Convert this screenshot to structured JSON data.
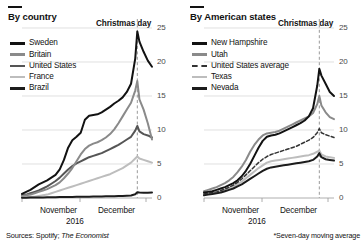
{
  "figure": {
    "width": 364,
    "height": 246,
    "source_text_prefix": "Sources: Spotify; ",
    "source_text_italic": "The Economist",
    "footnote": "*Seven-day moving average",
    "year_label": "2016"
  },
  "palette": {
    "black": "#121212",
    "dark_gray": "#555555",
    "mid_gray": "#8a8a8a",
    "light_gray": "#bdbdbd",
    "very_dark": "#1c1c1c",
    "grid": "#d2d2d2",
    "axis": "#9a9a9a",
    "tick_text": "#4a4a4a"
  },
  "panels": [
    {
      "id": "by-country",
      "title": "By country",
      "annotation": "Christmas day",
      "legend": [
        {
          "label": "Sweden",
          "color": "#121212",
          "style": "solid"
        },
        {
          "label": "Britain",
          "color": "#8a8a8a",
          "style": "solid"
        },
        {
          "label": "United States",
          "color": "#555555",
          "style": "solid"
        },
        {
          "label": "France",
          "color": "#bdbdbd",
          "style": "solid"
        },
        {
          "label": "Brazil",
          "color": "#1c1c1c",
          "style": "solid"
        }
      ],
      "chart_data": {
        "type": "line",
        "title": "By country",
        "xlabel": "2016",
        "ylabel": "",
        "ylim": [
          0,
          25
        ],
        "yticks": [
          0,
          5,
          10,
          15,
          20,
          25
        ],
        "ytick_labels": [
          "0",
          "5",
          "10",
          "15",
          "20",
          "25"
        ],
        "grid": true,
        "legend_position": "upper-left",
        "annotations": [
          {
            "text": "Christmas day",
            "x": 55,
            "style": "dashed-vertical"
          }
        ],
        "x_tick_labels": [
          "November",
          "December"
        ],
        "x": [
          0,
          2,
          4,
          6,
          8,
          10,
          12,
          14,
          16,
          18,
          20,
          22,
          24,
          26,
          28,
          30,
          32,
          34,
          36,
          38,
          40,
          42,
          44,
          46,
          48,
          50,
          52,
          54,
          55,
          56,
          58,
          60,
          62
        ],
        "series": [
          {
            "name": "Sweden",
            "color": "#121212",
            "style": "solid",
            "values": [
              0.6,
              0.9,
              1.2,
              1.6,
              2.0,
              2.3,
              2.6,
              3.0,
              3.4,
              4.2,
              5.6,
              7.4,
              8.5,
              9.0,
              9.6,
              11.5,
              12.1,
              12.2,
              12.3,
              12.6,
              13.0,
              13.4,
              13.9,
              14.3,
              14.8,
              15.6,
              16.8,
              20.5,
              24.5,
              23.0,
              21.5,
              20.2,
              19.3
            ]
          },
          {
            "name": "Britain",
            "color": "#8a8a8a",
            "style": "solid",
            "values": [
              0.3,
              0.4,
              0.5,
              0.7,
              0.9,
              1.1,
              1.3,
              1.6,
              1.9,
              2.3,
              2.9,
              3.6,
              4.4,
              5.4,
              6.4,
              7.2,
              7.7,
              8.0,
              8.2,
              8.5,
              8.9,
              9.4,
              10.1,
              11.0,
              12.0,
              13.0,
              14.0,
              15.8,
              17.2,
              14.5,
              13.0,
              11.0,
              8.6
            ]
          },
          {
            "name": "United States",
            "color": "#555555",
            "style": "solid",
            "values": [
              0.4,
              0.5,
              0.7,
              0.9,
              1.1,
              1.4,
              1.7,
              2.1,
              2.5,
              3.0,
              3.6,
              4.2,
              4.7,
              5.1,
              5.4,
              5.7,
              6.0,
              6.2,
              6.4,
              6.6,
              6.9,
              7.2,
              7.5,
              7.8,
              8.2,
              8.6,
              9.0,
              9.9,
              10.6,
              9.8,
              9.4,
              9.2,
              8.9
            ]
          },
          {
            "name": "France",
            "color": "#bdbdbd",
            "style": "solid",
            "values": [
              0.1,
              0.1,
              0.2,
              0.2,
              0.3,
              0.4,
              0.5,
              0.7,
              0.9,
              1.1,
              1.3,
              1.5,
              1.7,
              1.9,
              2.1,
              2.3,
              2.5,
              2.7,
              2.9,
              3.1,
              3.3,
              3.5,
              3.8,
              4.1,
              4.4,
              4.8,
              5.2,
              5.8,
              6.1,
              5.8,
              5.6,
              5.4,
              5.2
            ]
          },
          {
            "name": "Brazil",
            "color": "#1c1c1c",
            "style": "solid",
            "values": [
              0.05,
              0.05,
              0.06,
              0.07,
              0.08,
              0.09,
              0.1,
              0.11,
              0.12,
              0.13,
              0.14,
              0.15,
              0.16,
              0.17,
              0.18,
              0.19,
              0.2,
              0.21,
              0.22,
              0.23,
              0.24,
              0.25,
              0.27,
              0.29,
              0.31,
              0.34,
              0.38,
              0.55,
              0.85,
              0.8,
              0.78,
              0.78,
              0.8
            ]
          }
        ]
      }
    },
    {
      "id": "by-american-states",
      "title": "By American states",
      "annotation": "Christmas day",
      "legend": [
        {
          "label": "New Hampshire",
          "color": "#121212",
          "style": "solid"
        },
        {
          "label": "Utah",
          "color": "#8a8a8a",
          "style": "solid"
        },
        {
          "label": "United States average",
          "color": "#333333",
          "style": "dashed"
        },
        {
          "label": "Texas",
          "color": "#bdbdbd",
          "style": "solid"
        },
        {
          "label": "Nevada",
          "color": "#1c1c1c",
          "style": "solid"
        }
      ],
      "chart_data": {
        "type": "line",
        "title": "By American states",
        "xlabel": "2016",
        "ylabel": "",
        "ylim": [
          0,
          25
        ],
        "yticks": [
          0,
          5,
          10,
          15,
          20,
          25
        ],
        "ytick_labels": [
          "0",
          "5",
          "10",
          "15",
          "20",
          "25"
        ],
        "grid": true,
        "legend_position": "upper-left",
        "annotations": [
          {
            "text": "Christmas day",
            "x": 55,
            "style": "dashed-vertical"
          }
        ],
        "x_tick_labels": [
          "November",
          "December"
        ],
        "x": [
          0,
          2,
          4,
          6,
          8,
          10,
          12,
          14,
          16,
          18,
          20,
          22,
          24,
          26,
          28,
          30,
          32,
          34,
          36,
          38,
          40,
          42,
          44,
          46,
          48,
          50,
          52,
          54,
          55,
          56,
          58,
          60,
          62
        ],
        "series": [
          {
            "name": "New Hampshire",
            "color": "#121212",
            "style": "solid",
            "values": [
              0.8,
              0.9,
              1.0,
              1.2,
              1.4,
              1.6,
              1.9,
              2.2,
              2.6,
              3.2,
              4.0,
              5.0,
              6.2,
              7.4,
              8.4,
              9.0,
              9.2,
              9.3,
              9.5,
              9.8,
              10.1,
              10.4,
              10.7,
              11.0,
              11.4,
              12.0,
              13.2,
              16.5,
              19.0,
              18.0,
              16.8,
              15.6,
              15.0
            ]
          },
          {
            "name": "Utah",
            "color": "#8a8a8a",
            "style": "solid",
            "values": [
              1.0,
              1.2,
              1.4,
              1.6,
              1.9,
              2.2,
              2.6,
              3.1,
              3.8,
              4.6,
              5.6,
              6.8,
              7.8,
              8.6,
              9.2,
              9.5,
              9.6,
              9.7,
              9.9,
              10.2,
              10.5,
              10.8,
              11.1,
              11.4,
              11.7,
              12.0,
              12.5,
              13.8,
              15.0,
              13.6,
              12.6,
              11.9,
              11.6
            ]
          },
          {
            "name": "United States average",
            "color": "#333333",
            "style": "dashed",
            "values": [
              0.6,
              0.7,
              0.8,
              0.9,
              1.1,
              1.3,
              1.6,
              1.9,
              2.3,
              2.8,
              3.4,
              4.0,
              4.6,
              5.2,
              5.7,
              6.1,
              6.4,
              6.6,
              6.8,
              7.0,
              7.2,
              7.4,
              7.6,
              7.9,
              8.2,
              8.5,
              8.9,
              9.6,
              10.2,
              9.6,
              9.3,
              9.1,
              8.9
            ]
          },
          {
            "name": "Texas",
            "color": "#bdbdbd",
            "style": "solid",
            "values": [
              0.5,
              0.6,
              0.7,
              0.8,
              1.0,
              1.2,
              1.4,
              1.7,
              2.0,
              2.4,
              2.9,
              3.4,
              3.9,
              4.4,
              4.8,
              5.2,
              5.4,
              5.5,
              5.6,
              5.7,
              5.8,
              5.9,
              6.0,
              6.1,
              6.2,
              6.3,
              6.5,
              6.8,
              7.0,
              6.4,
              6.1,
              6.0,
              5.9
            ]
          },
          {
            "name": "Nevada",
            "color": "#1c1c1c",
            "style": "solid",
            "values": [
              0.4,
              0.5,
              0.6,
              0.7,
              0.8,
              1.0,
              1.2,
              1.4,
              1.7,
              2.0,
              2.4,
              2.8,
              3.2,
              3.6,
              4.0,
              4.3,
              4.5,
              4.6,
              4.7,
              4.8,
              4.9,
              5.0,
              5.1,
              5.2,
              5.3,
              5.4,
              5.6,
              6.1,
              6.6,
              6.0,
              5.7,
              5.6,
              5.5
            ]
          }
        ]
      }
    }
  ]
}
